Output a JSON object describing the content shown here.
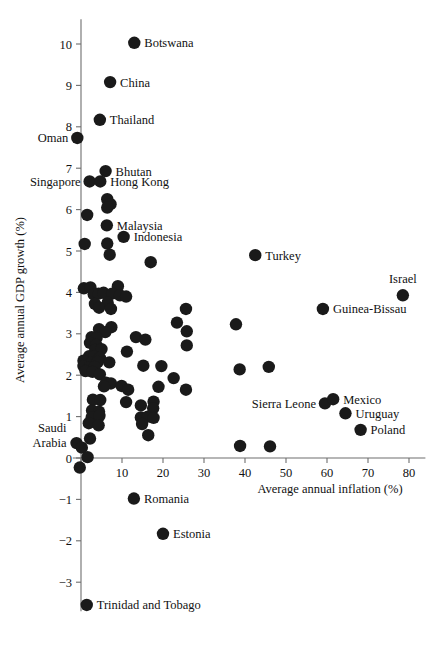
{
  "chart_data": {
    "type": "scatter",
    "title": "",
    "xlabel": "Average annual inflation (%)",
    "ylabel": "Average annual GDP growth (%)",
    "xlim": [
      -2,
      84
    ],
    "ylim": [
      -3.7,
      10.6
    ],
    "xticks": [
      0,
      10,
      20,
      30,
      40,
      50,
      60,
      70,
      80
    ],
    "xticklabels": [
      "",
      "10",
      "20",
      "30",
      "40",
      "50",
      "60",
      "70",
      "80"
    ],
    "yticks": [
      -3,
      -2,
      -1,
      0,
      1,
      2,
      3,
      4,
      5,
      6,
      7,
      8,
      9,
      10
    ],
    "yticklabels": [
      "−3",
      "−2",
      "−1",
      "0",
      "1",
      "2",
      "3",
      "4",
      "5",
      "6",
      "7",
      "8",
      "9",
      "10"
    ],
    "grid": false,
    "legend": "none",
    "marker_color": "#1a1a1a",
    "marker_size": 7.6,
    "points": [
      {
        "x": 13.0,
        "y": 10.03,
        "label": "Botswana",
        "side": "right"
      },
      {
        "x": 7.1,
        "y": 9.08,
        "label": "China",
        "side": "right"
      },
      {
        "x": 4.6,
        "y": 8.17,
        "label": "Thailand",
        "side": "right"
      },
      {
        "x": -0.9,
        "y": 7.73,
        "label": "Oman",
        "side": "left"
      },
      {
        "x": 6.0,
        "y": 6.93,
        "label": "Bhutan",
        "side": "right"
      },
      {
        "x": 2.1,
        "y": 6.68,
        "label": "Singapore",
        "side": "left"
      },
      {
        "x": 4.7,
        "y": 6.68,
        "label": "Hong Kong",
        "side": "right"
      },
      {
        "x": 6.4,
        "y": 6.25,
        "label": "",
        "side": "right"
      },
      {
        "x": 7.2,
        "y": 6.13,
        "label": "",
        "side": "right"
      },
      {
        "x": 6.4,
        "y": 6.05,
        "label": "",
        "side": "right"
      },
      {
        "x": 1.5,
        "y": 5.87,
        "label": "",
        "side": "right"
      },
      {
        "x": 6.3,
        "y": 5.62,
        "label": "Malaysia",
        "side": "right"
      },
      {
        "x": 10.4,
        "y": 5.34,
        "label": "Indonesia",
        "side": "right"
      },
      {
        "x": 6.4,
        "y": 5.18,
        "label": "",
        "side": "right"
      },
      {
        "x": 0.9,
        "y": 5.17,
        "label": "",
        "side": "right"
      },
      {
        "x": 7.0,
        "y": 4.91,
        "label": "",
        "side": "right"
      },
      {
        "x": 42.5,
        "y": 4.9,
        "label": "Turkey",
        "side": "right"
      },
      {
        "x": 17.0,
        "y": 4.73,
        "label": "",
        "side": "right"
      },
      {
        "x": 0.7,
        "y": 4.1,
        "label": "",
        "side": "right"
      },
      {
        "x": 2.3,
        "y": 4.12,
        "label": "",
        "side": "right"
      },
      {
        "x": 9.0,
        "y": 4.15,
        "label": "",
        "side": "right"
      },
      {
        "x": 3.1,
        "y": 3.95,
        "label": "",
        "side": "right"
      },
      {
        "x": 4.3,
        "y": 3.97,
        "label": "",
        "side": "right"
      },
      {
        "x": 5.5,
        "y": 3.99,
        "label": "",
        "side": "right"
      },
      {
        "x": 7.6,
        "y": 3.97,
        "label": "",
        "side": "right"
      },
      {
        "x": 9.5,
        "y": 3.93,
        "label": "",
        "side": "right"
      },
      {
        "x": 11.0,
        "y": 3.9,
        "label": "",
        "side": "right"
      },
      {
        "x": 3.4,
        "y": 3.72,
        "label": "",
        "side": "right"
      },
      {
        "x": 6.5,
        "y": 3.75,
        "label": "",
        "side": "right"
      },
      {
        "x": 4.4,
        "y": 3.63,
        "label": "",
        "side": "right"
      },
      {
        "x": 7.3,
        "y": 3.6,
        "label": "",
        "side": "right"
      },
      {
        "x": 25.6,
        "y": 3.6,
        "label": "",
        "side": "right"
      },
      {
        "x": 78.5,
        "y": 3.93,
        "label": "Israel",
        "side": "above"
      },
      {
        "x": 59.0,
        "y": 3.6,
        "label": "Guinea-Bissau",
        "side": "right"
      },
      {
        "x": 23.4,
        "y": 3.27,
        "label": "",
        "side": "right"
      },
      {
        "x": 37.8,
        "y": 3.23,
        "label": "",
        "side": "right"
      },
      {
        "x": 7.4,
        "y": 3.16,
        "label": "",
        "side": "right"
      },
      {
        "x": 4.4,
        "y": 3.11,
        "label": "",
        "side": "right"
      },
      {
        "x": 5.9,
        "y": 3.04,
        "label": "",
        "side": "right"
      },
      {
        "x": 25.8,
        "y": 3.06,
        "label": "",
        "side": "right"
      },
      {
        "x": 2.6,
        "y": 2.92,
        "label": "",
        "side": "right"
      },
      {
        "x": 3.8,
        "y": 2.9,
        "label": "",
        "side": "right"
      },
      {
        "x": 13.4,
        "y": 2.92,
        "label": "",
        "side": "right"
      },
      {
        "x": 15.7,
        "y": 2.86,
        "label": "",
        "side": "right"
      },
      {
        "x": 2.2,
        "y": 2.78,
        "label": "",
        "side": "right"
      },
      {
        "x": 3.7,
        "y": 2.73,
        "label": "",
        "side": "right"
      },
      {
        "x": 25.8,
        "y": 2.72,
        "label": "",
        "side": "right"
      },
      {
        "x": 3.5,
        "y": 2.61,
        "label": "",
        "side": "right"
      },
      {
        "x": 5.0,
        "y": 2.63,
        "label": "",
        "side": "right"
      },
      {
        "x": 11.2,
        "y": 2.57,
        "label": "",
        "side": "right"
      },
      {
        "x": 2.0,
        "y": 2.46,
        "label": "",
        "side": "right"
      },
      {
        "x": 3.2,
        "y": 2.45,
        "label": "",
        "side": "right"
      },
      {
        "x": 4.6,
        "y": 2.42,
        "label": "",
        "side": "right"
      },
      {
        "x": 0.6,
        "y": 2.35,
        "label": "",
        "side": "right"
      },
      {
        "x": 2.5,
        "y": 2.3,
        "label": "",
        "side": "right"
      },
      {
        "x": 4.1,
        "y": 2.32,
        "label": "",
        "side": "right"
      },
      {
        "x": 6.9,
        "y": 2.31,
        "label": "",
        "side": "right"
      },
      {
        "x": 0.6,
        "y": 2.22,
        "label": "",
        "side": "right"
      },
      {
        "x": 2.0,
        "y": 2.19,
        "label": "",
        "side": "right"
      },
      {
        "x": 3.3,
        "y": 2.2,
        "label": "",
        "side": "right"
      },
      {
        "x": 15.2,
        "y": 2.23,
        "label": "",
        "side": "right"
      },
      {
        "x": 19.6,
        "y": 2.22,
        "label": "",
        "side": "right"
      },
      {
        "x": 45.8,
        "y": 2.2,
        "label": "",
        "side": "right"
      },
      {
        "x": 38.7,
        "y": 2.14,
        "label": "",
        "side": "right"
      },
      {
        "x": 1.1,
        "y": 2.1,
        "label": "",
        "side": "right"
      },
      {
        "x": 2.8,
        "y": 2.08,
        "label": "",
        "side": "right"
      },
      {
        "x": 4.6,
        "y": 2.02,
        "label": "",
        "side": "right"
      },
      {
        "x": 22.6,
        "y": 1.93,
        "label": "",
        "side": "right"
      },
      {
        "x": 6.1,
        "y": 1.82,
        "label": "",
        "side": "right"
      },
      {
        "x": 7.3,
        "y": 1.8,
        "label": "",
        "side": "right"
      },
      {
        "x": 5.6,
        "y": 1.73,
        "label": "",
        "side": "right"
      },
      {
        "x": 9.9,
        "y": 1.74,
        "label": "",
        "side": "right"
      },
      {
        "x": 18.9,
        "y": 1.72,
        "label": "",
        "side": "right"
      },
      {
        "x": 25.6,
        "y": 1.65,
        "label": "",
        "side": "right"
      },
      {
        "x": 11.5,
        "y": 1.65,
        "label": "",
        "side": "right"
      },
      {
        "x": 2.9,
        "y": 1.41,
        "label": "",
        "side": "right"
      },
      {
        "x": 4.7,
        "y": 1.4,
        "label": "",
        "side": "right"
      },
      {
        "x": 11.0,
        "y": 1.35,
        "label": "",
        "side": "right"
      },
      {
        "x": 17.7,
        "y": 1.36,
        "label": "",
        "side": "right"
      },
      {
        "x": 14.6,
        "y": 1.27,
        "label": "",
        "side": "right"
      },
      {
        "x": 17.6,
        "y": 1.2,
        "label": "",
        "side": "right"
      },
      {
        "x": 2.7,
        "y": 1.15,
        "label": "",
        "side": "right"
      },
      {
        "x": 4.4,
        "y": 1.12,
        "label": "",
        "side": "right"
      },
      {
        "x": 59.5,
        "y": 1.32,
        "label": "Sierra Leone",
        "side": "left"
      },
      {
        "x": 61.5,
        "y": 1.42,
        "label": "Mexico",
        "side": "right"
      },
      {
        "x": 2.6,
        "y": 0.98,
        "label": "",
        "side": "right"
      },
      {
        "x": 4.5,
        "y": 1.02,
        "label": "",
        "side": "right"
      },
      {
        "x": 14.6,
        "y": 0.98,
        "label": "",
        "side": "right"
      },
      {
        "x": 16.3,
        "y": 1.0,
        "label": "",
        "side": "right"
      },
      {
        "x": 17.7,
        "y": 0.97,
        "label": "",
        "side": "right"
      },
      {
        "x": 1.9,
        "y": 0.84,
        "label": "",
        "side": "right"
      },
      {
        "x": 4.3,
        "y": 0.79,
        "label": "",
        "side": "right"
      },
      {
        "x": 14.9,
        "y": 0.82,
        "label": "",
        "side": "right"
      },
      {
        "x": 64.5,
        "y": 1.08,
        "label": "Uruguay",
        "side": "right"
      },
      {
        "x": 68.2,
        "y": 0.68,
        "label": "Poland",
        "side": "right"
      },
      {
        "x": 16.4,
        "y": 0.55,
        "label": "",
        "side": "right"
      },
      {
        "x": 2.2,
        "y": 0.47,
        "label": "",
        "side": "right"
      },
      {
        "x": -1.1,
        "y": 0.36,
        "label": "Saudi Arabia",
        "side": "left"
      },
      {
        "x": 0.2,
        "y": 0.25,
        "label": "",
        "side": "right"
      },
      {
        "x": 38.8,
        "y": 0.29,
        "label": "",
        "side": "right"
      },
      {
        "x": 46.1,
        "y": 0.28,
        "label": "",
        "side": "right"
      },
      {
        "x": 1.6,
        "y": 0.02,
        "label": "",
        "side": "right"
      },
      {
        "x": -0.3,
        "y": -0.23,
        "label": "",
        "side": "right"
      },
      {
        "x": 12.9,
        "y": -0.98,
        "label": "Romania",
        "side": "right"
      },
      {
        "x": 20.0,
        "y": -1.83,
        "label": "Estonia",
        "side": "right"
      },
      {
        "x": 1.4,
        "y": -3.55,
        "label": "Trinidad and Tobago",
        "side": "right"
      }
    ]
  }
}
